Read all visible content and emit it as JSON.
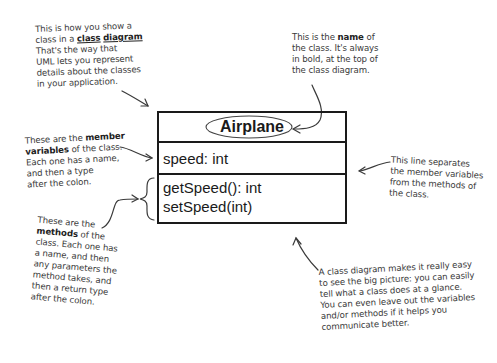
{
  "uml_class": {
    "name": "Airplane",
    "attributes": [
      "speed: int"
    ],
    "methods": [
      "getSpeed(): int",
      "setSpeed(int)"
    ]
  },
  "annotations": {
    "class_diagram": {
      "line1": "This is how you show a",
      "line2_pre": "class in a ",
      "line2_link1": "class",
      "line2_link2": "diagram",
      "line3": "That's the way that",
      "line4": "UML lets you represent",
      "line5": "details about the classes",
      "line6": "in your application."
    },
    "class_name": {
      "line1_pre": "This is the ",
      "line1_bold": "name",
      "line1_post": " of",
      "line2": "the class. It's always",
      "line3": "in bold, at the top of",
      "line4": "the class diagram."
    },
    "member_variables": {
      "line1_pre": "These are the ",
      "line1_bold": "member",
      "line2_bold": "variables",
      "line2_post": " of the class.",
      "line3": "Each one has a name,",
      "line4": "and then a type",
      "line5": "after the colon."
    },
    "separator": {
      "line1": "This line separates",
      "line2": "the member variables",
      "line3": "from the methods of",
      "line4": "the class."
    },
    "methods": {
      "line1": "These are the",
      "line2_bold": "methods",
      "line2_post": " of the",
      "line3": "class. Each one has",
      "line4": "a name, and then",
      "line5": "any parameters the",
      "line6": "method takes, and",
      "line7": "then a return type",
      "line8": "after the colon."
    },
    "big_picture": {
      "line1": "A class diagram makes it really easy",
      "line2": "to see the big picture: you can easily",
      "line3": "tell what a class does at a glance.",
      "line4": "You can even leave out the variables",
      "line5": "and/or methods if it helps you",
      "line6": "communicate better."
    }
  }
}
